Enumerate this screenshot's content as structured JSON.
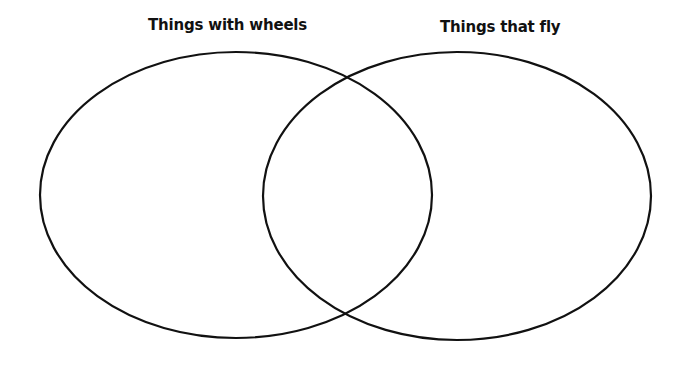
{
  "diagram": {
    "type": "venn",
    "sets": [
      {
        "label": "Things with wheels",
        "shape": "ellipse",
        "cx": 236,
        "cy": 195,
        "rx": 196,
        "ry": 143
      },
      {
        "label": "Things that fly",
        "shape": "ellipse",
        "cx": 457,
        "cy": 196,
        "rx": 194,
        "ry": 144
      }
    ],
    "stroke_color": "#111111",
    "background_color": "#ffffff"
  }
}
